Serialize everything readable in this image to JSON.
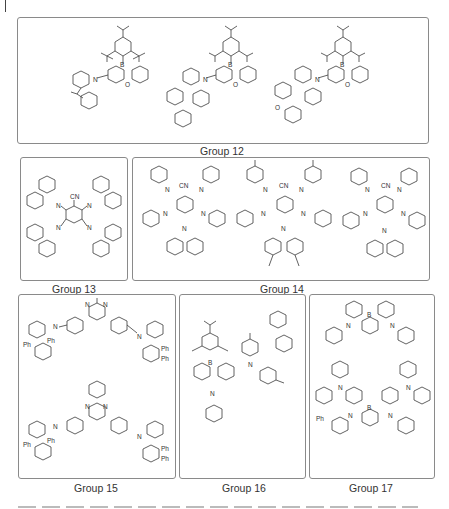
{
  "figure": {
    "groups": [
      {
        "id": "g12",
        "label": "Group 12",
        "atom_labels": [
          "B",
          "O",
          "N"
        ],
        "structure_count": 3
      },
      {
        "id": "g13",
        "label": "Group 13",
        "atom_labels": [
          "CN",
          "N"
        ],
        "structure_count": 1
      },
      {
        "id": "g14",
        "label": "Group 14",
        "atom_labels": [
          "CN",
          "N"
        ],
        "structure_count": 3
      },
      {
        "id": "g15",
        "label": "Group 15",
        "atom_labels": [
          "N",
          "Ph"
        ],
        "structure_count": 2
      },
      {
        "id": "g16",
        "label": "Group 16",
        "atom_labels": [
          "B",
          "N"
        ],
        "structure_count": 1
      },
      {
        "id": "g17",
        "label": "Group 17",
        "atom_labels": [
          "B",
          "N",
          "Ph"
        ],
        "structure_count": 2
      }
    ],
    "atoms": {
      "B": "B",
      "O": "O",
      "N": "N",
      "CN": "CN",
      "Ph": "Ph"
    },
    "caption_truncated": true
  }
}
